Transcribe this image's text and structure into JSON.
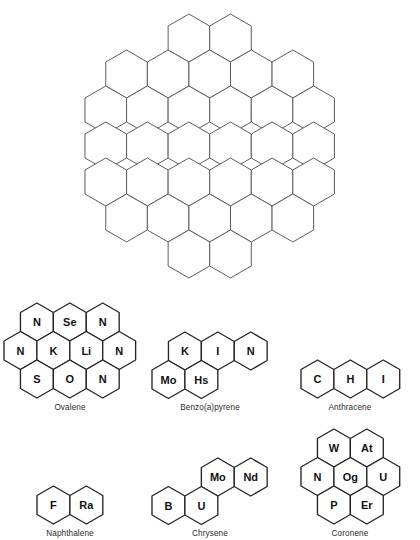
{
  "page": {
    "background_color": "#ffffff",
    "clipped_header_text": "",
    "width": 420,
    "height": 540
  },
  "main_lattice": {
    "name": "large-honeycomb-lattice",
    "stroke_color": "#5b5b63",
    "fill_color": "#ffffff",
    "hex_radius": 24,
    "orientation": "pointy-top",
    "row_counts": [
      2,
      5,
      6,
      6,
      6,
      5,
      2
    ],
    "total_cells": 32,
    "labels": []
  },
  "molecules": [
    {
      "id": "ovalene",
      "caption": "Ovalene",
      "hex_radius": 19,
      "orientation": "pointy-top",
      "rows": [
        {
          "offset": 0.5,
          "symbols": [
            "N",
            "Se",
            "N"
          ]
        },
        {
          "offset": 0.0,
          "symbols": [
            "N",
            "K",
            "Li",
            "N"
          ]
        },
        {
          "offset": 0.5,
          "symbols": [
            "S",
            "O",
            "N"
          ]
        }
      ]
    },
    {
      "id": "benzo-a-pyrene",
      "caption": "Benzo(a)pyrene",
      "hex_radius": 19,
      "orientation": "pointy-top",
      "rows": [
        {
          "offset": 0.5,
          "symbols": [
            "K",
            "I",
            "N"
          ]
        },
        {
          "offset": 0.0,
          "symbols": [
            "Mo",
            "Hs"
          ]
        }
      ]
    },
    {
      "id": "anthracene",
      "caption": "Anthracene",
      "hex_radius": 19,
      "orientation": "pointy-top",
      "rows": [
        {
          "offset": 0.0,
          "symbols": [
            "C",
            "H",
            "I"
          ]
        }
      ]
    },
    {
      "id": "naphthalene",
      "caption": "Naphthalene",
      "hex_radius": 19,
      "orientation": "pointy-top",
      "rows": [
        {
          "offset": 0.0,
          "symbols": [
            "F",
            "Ra"
          ]
        }
      ]
    },
    {
      "id": "chrysene",
      "caption": "Chrysene",
      "hex_radius": 19,
      "orientation": "pointy-top",
      "rows": [
        {
          "offset": 1.5,
          "symbols": [
            "Mo",
            "Nd"
          ]
        },
        {
          "offset": 0.0,
          "symbols": [
            "B",
            "U"
          ]
        }
      ]
    },
    {
      "id": "coronene",
      "caption": "Coronene",
      "hex_radius": 19,
      "orientation": "pointy-top",
      "rows": [
        {
          "offset": 0.5,
          "symbols": [
            "W",
            "At"
          ]
        },
        {
          "offset": 0.0,
          "symbols": [
            "N",
            "Og",
            "U"
          ]
        },
        {
          "offset": 0.5,
          "symbols": [
            "P",
            "Er"
          ]
        }
      ]
    }
  ]
}
